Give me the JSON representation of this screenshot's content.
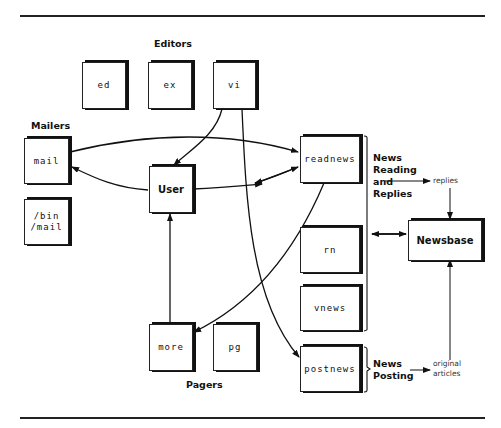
{
  "diagram": {
    "groups": {
      "editors": "Editors",
      "mailers": "Mailers",
      "pagers": "Pagers",
      "news_reading": "News\nReading\nand\nReplies",
      "news_posting": "News\nPosting"
    },
    "nodes": {
      "ed": "ed",
      "ex": "ex",
      "vi": "vi",
      "mail": "mail",
      "bin_mail": "/bin\n/mail",
      "user": "User",
      "readnews": "readnews",
      "rn": "rn",
      "vnews": "vnews",
      "postnews": "postnews",
      "more": "more",
      "pg": "pg",
      "newsbase": "Newsbase"
    },
    "annotations": {
      "replies": "replies",
      "original_articles": "original\narticles"
    },
    "edges": [
      {
        "from": "vi",
        "to": "User"
      },
      {
        "from": "vi",
        "to": "postnews"
      },
      {
        "from": "mail",
        "to": "readnews",
        "bidirectional": true
      },
      {
        "from": "User",
        "to": "mail"
      },
      {
        "from": "User",
        "to": "readnews",
        "bidirectional": true
      },
      {
        "from": "readnews",
        "to": "more"
      },
      {
        "from": "more",
        "to": "User"
      },
      {
        "from": "News Reading and Replies",
        "to": "Newsbase",
        "bidirectional": true
      },
      {
        "from": "News Reading and Replies",
        "to": "replies"
      },
      {
        "from": "replies",
        "to": "Newsbase"
      },
      {
        "from": "News Posting",
        "to": "original articles"
      },
      {
        "from": "original articles",
        "to": "Newsbase"
      }
    ]
  }
}
